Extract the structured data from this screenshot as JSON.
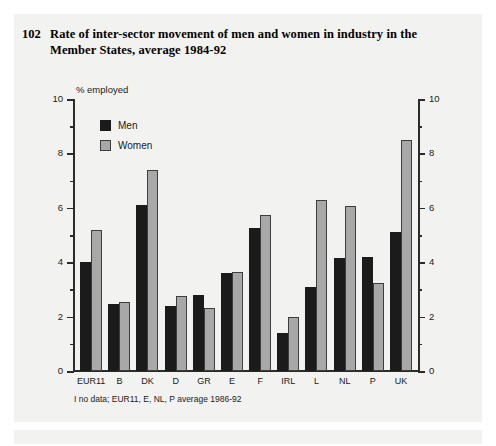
{
  "figure": {
    "number": "102",
    "title": "Rate of inter-sector movement of men and women in industry in the Member States, average 1984-92",
    "footnote": "I no data; EUR11, E, NL, P average 1986-92"
  },
  "chart_data": {
    "type": "bar",
    "title": "Rate of inter-sector movement of men and women in industry in the Member States, average 1984-92",
    "xlabel": "",
    "ylabel": "% employed",
    "ylim": [
      0,
      10
    ],
    "yticks": [
      0,
      2,
      4,
      6,
      8,
      10
    ],
    "yticks_minor": [
      1,
      3,
      5,
      7,
      9
    ],
    "grid": false,
    "legend_position": "top-left",
    "dual_axis": true,
    "categories": [
      "EUR11",
      "B",
      "DK",
      "D",
      "GR",
      "E",
      "F",
      "IRL",
      "L",
      "NL",
      "P",
      "UK"
    ],
    "series": [
      {
        "name": "Men",
        "color": "#1b1b1b",
        "values": [
          4.0,
          2.45,
          6.1,
          2.4,
          2.8,
          3.6,
          5.25,
          1.4,
          3.1,
          4.15,
          4.2,
          5.1
        ]
      },
      {
        "name": "Women",
        "color": "#a8a8a8",
        "values": [
          5.2,
          2.55,
          7.4,
          2.75,
          2.3,
          3.65,
          5.75,
          2.0,
          6.3,
          6.05,
          3.25,
          8.5
        ]
      }
    ]
  },
  "axis": {
    "unit_label": "% employed",
    "left_ticks": [
      "10",
      "8",
      "6",
      "4",
      "2",
      "0"
    ],
    "right_ticks": [
      "10",
      "8",
      "6",
      "4",
      "2",
      "0"
    ]
  }
}
